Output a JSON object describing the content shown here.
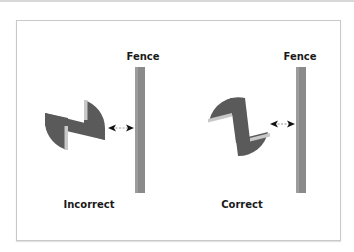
{
  "diagram": {
    "left": {
      "fence_label": "Fence",
      "caption": "Incorrect"
    },
    "right": {
      "fence_label": "Fence",
      "caption": "Correct"
    }
  },
  "colors": {
    "cutter": "#5a5a5a",
    "insert": "#c8c8c8",
    "fence": "#8a8a8a",
    "arrow": "#111111",
    "border": "#c9c9c9"
  }
}
